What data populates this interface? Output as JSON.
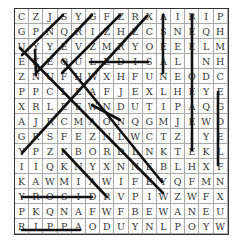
{
  "puzzle": {
    "type": "word-search",
    "rows": [
      "CZJSYGFZRXAIBIP",
      "GPNQRIZHZCSNEQH",
      "UYYEVZMRYOEEELM",
      "EKEOULEDISALINH",
      "ZNUFHWXHFUNEODC",
      "PPCLEAFJEXLHEYE",
      "XRLEEWNDUTIPAQG",
      "AJRCMAONQGMJEWD",
      "GRSFEZNLWCTZIYE",
      "YPZKBORDLNKTEKL",
      "IIQKNYXNNEBLHXF",
      "KAWMIAWIFEYQFMN",
      "YROSIDRVPIWZWFX",
      "PKQNAFWFBEWANEU",
      "RIPPAODUYNLPOYW"
    ],
    "found_lines": [
      [
        63,
        15,
        22,
        55
      ],
      [
        35,
        50,
        36,
        75
      ],
      [
        92,
        15,
        37,
        72
      ],
      [
        120,
        15,
        62,
        73
      ],
      [
        147,
        16,
        22,
        153
      ],
      [
        20,
        48,
        163,
        193
      ],
      [
        63,
        60,
        162,
        182
      ],
      [
        92,
        105,
        120,
        120
      ],
      [
        63,
        150,
        107,
        197
      ],
      [
        90,
        62,
        148,
        62
      ],
      [
        163,
        15,
        163,
        73
      ],
      [
        192,
        15,
        192,
        150
      ],
      [
        218,
        92,
        218,
        165
      ],
      [
        22,
        197,
        92,
        197
      ],
      [
        22,
        230,
        80,
        230
      ]
    ],
    "line_color": "#111111"
  }
}
